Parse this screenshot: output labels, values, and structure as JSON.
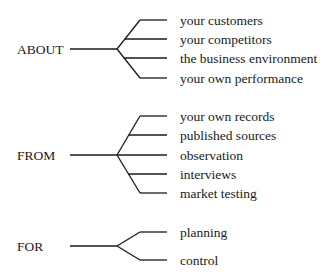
{
  "groups": [
    {
      "label": "ABOUT",
      "items": [
        "your customers",
        "your competitors",
        "the business environment",
        "your own performance"
      ]
    },
    {
      "label": "FROM",
      "items": [
        "your own records",
        "published sources",
        "observation",
        "interviews",
        "market testing"
      ]
    },
    {
      "label": "FOR",
      "items": [
        "planning",
        "control"
      ]
    }
  ]
}
